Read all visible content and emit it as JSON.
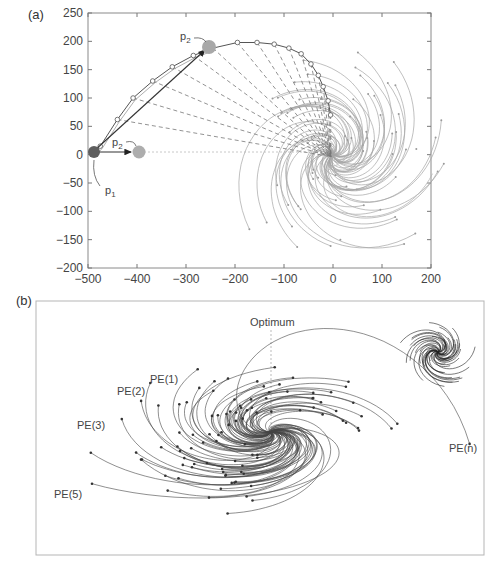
{
  "panels": {
    "a": {
      "label": "(a)",
      "point_labels": {
        "p1": "p",
        "p1_sub": "1",
        "p2": "p",
        "p2_sub": "2",
        "p2b": "p",
        "p2b_sub": "2"
      }
    },
    "b": {
      "label": "(b)",
      "optimum_label": "Optimum",
      "pe_labels": [
        "PE(1)",
        "PE(2)",
        "PE(3)",
        "PE(5)",
        "PE(n)"
      ]
    }
  },
  "colors": {
    "axis": "#555555",
    "traj_light": "#9a9a9a",
    "traj_dark": "#3a3a3a",
    "marker_p1": "#5a5a5a",
    "marker_p2": "#a8a8a8",
    "dashed": "#777777"
  },
  "chart_data": [
    {
      "type": "scatter",
      "title": "(a)",
      "xlabel": "",
      "ylabel": "",
      "xlim": [
        -500,
        200
      ],
      "ylim": [
        -200,
        250
      ],
      "x_ticks": [
        -500,
        -400,
        -300,
        -200,
        -100,
        0,
        100,
        200
      ],
      "y_ticks": [
        -200,
        -150,
        -100,
        -50,
        0,
        50,
        100,
        150,
        200,
        250
      ],
      "x_tick_labels": [
        "−500",
        "−400",
        "−300",
        "−200",
        "−100",
        "0",
        "100",
        "200"
      ],
      "y_tick_labels": [
        "−200",
        "−150",
        "−100",
        "−50",
        "0",
        "50",
        "100",
        "150",
        "200",
        "250"
      ],
      "grid": false,
      "series": [
        {
          "name": "p1",
          "points": [
            [
              -488,
              2
            ]
          ]
        },
        {
          "name": "p2 (initial)",
          "points": [
            [
              -390,
              2
            ]
          ]
        },
        {
          "name": "p2 (rotated)",
          "points": [
            [
              -245,
              188
            ]
          ]
        },
        {
          "name": "circle arc trajectory",
          "points": [
            [
              -488,
              2
            ],
            [
              -475,
              15
            ],
            [
              -440,
              62
            ],
            [
              -408,
              100
            ],
            [
              -368,
              130
            ],
            [
              -328,
              155
            ],
            [
              -285,
              175
            ],
            [
              -245,
              188
            ],
            [
              -195,
              198
            ],
            [
              -155,
              198
            ],
            [
              -120,
              195
            ],
            [
              -90,
              188
            ],
            [
              -65,
              178
            ],
            [
              -45,
              160
            ],
            [
              -30,
              140
            ],
            [
              -20,
              120
            ],
            [
              -10,
              95
            ],
            [
              -5,
              70
            ]
          ]
        }
      ],
      "annotations": [
        "p1",
        "p2",
        "p2"
      ],
      "optimum": [
        0,
        0
      ]
    },
    {
      "type": "line",
      "title": "(b)",
      "description": "Spiral trajectories of multiple processing elements converging to a common optimum; inset shows a smaller spiral cluster.",
      "annotations": [
        "Optimum",
        "PE(1)",
        "PE(2)",
        "PE(3)",
        "PE(5)",
        "PE(n)"
      ],
      "axes_visible": false
    }
  ]
}
